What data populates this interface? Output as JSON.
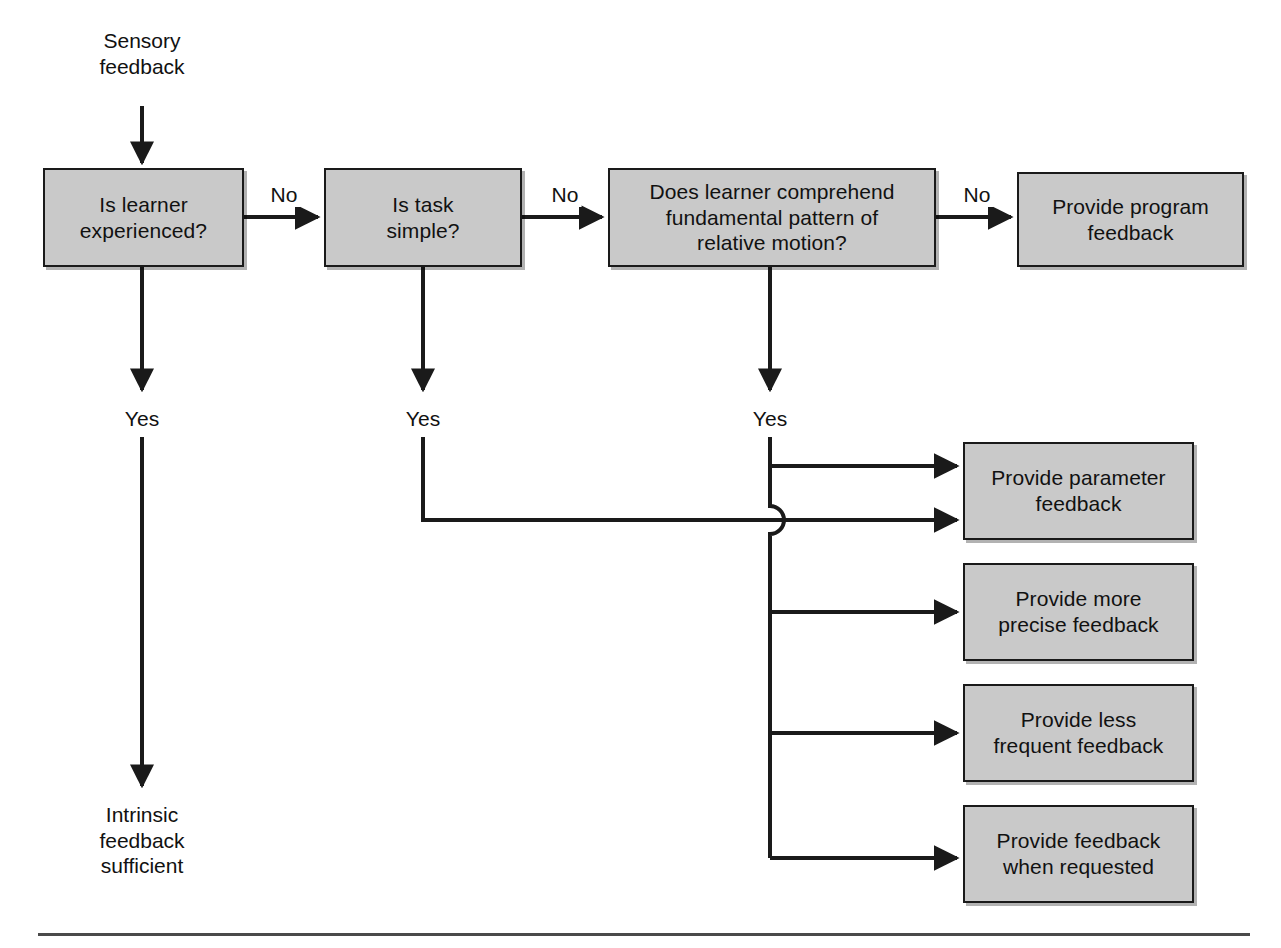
{
  "diagram": {
    "type": "flowchart",
    "colors": {
      "node_fill": "#c9c9c9",
      "node_border": "#1a1a1a",
      "wire": "#1a1a1a",
      "text": "#111111",
      "rule": "#4a4a4a"
    },
    "entry_label": "Sensory\nfeedback",
    "terminal_label": "Intrinsic\nfeedback\nsufficient",
    "nodes": [
      {
        "id": "is-learner-experienced",
        "label": "Is learner\nexperienced?",
        "x": 43,
        "y": 168,
        "w": 201,
        "h": 99
      },
      {
        "id": "is-task-simple",
        "label": "Is task\nsimple?",
        "x": 324,
        "y": 168,
        "w": 198,
        "h": 99
      },
      {
        "id": "does-learner-comprehend",
        "label": "Does learner comprehend\nfundamental pattern of\nrelative motion?",
        "x": 608,
        "y": 168,
        "w": 328,
        "h": 99
      },
      {
        "id": "provide-program-feedback",
        "label": "Provide program\nfeedback",
        "x": 1017,
        "y": 172,
        "w": 227,
        "h": 95
      },
      {
        "id": "provide-parameter-feedback",
        "label": "Provide parameter\nfeedback",
        "x": 963,
        "y": 442,
        "w": 231,
        "h": 98
      },
      {
        "id": "provide-more-precise-feedback",
        "label": "Provide more\nprecise feedback",
        "x": 963,
        "y": 563,
        "w": 231,
        "h": 98
      },
      {
        "id": "provide-less-frequent-feedback",
        "label": "Provide less\nfrequent feedback",
        "x": 963,
        "y": 684,
        "w": 231,
        "h": 98
      },
      {
        "id": "provide-feedback-when-requested",
        "label": "Provide feedback\nwhen requested",
        "x": 963,
        "y": 805,
        "w": 231,
        "h": 98
      }
    ],
    "edge_labels": [
      {
        "id": "no-1",
        "text": "No",
        "x": 284,
        "y": 182
      },
      {
        "id": "no-2",
        "text": "No",
        "x": 565,
        "y": 182
      },
      {
        "id": "no-3",
        "text": "No",
        "x": 977,
        "y": 182
      },
      {
        "id": "yes-1",
        "text": "Yes",
        "x": 142,
        "y": 406
      },
      {
        "id": "yes-2",
        "text": "Yes",
        "x": 423,
        "y": 406
      },
      {
        "id": "yes-3",
        "text": "Yes",
        "x": 770,
        "y": 406
      }
    ],
    "edges": [
      {
        "from": "sensory-feedback",
        "to": "is-learner-experienced",
        "label": ""
      },
      {
        "from": "is-learner-experienced",
        "to": "is-task-simple",
        "label": "No"
      },
      {
        "from": "is-task-simple",
        "to": "does-learner-comprehend",
        "label": "No"
      },
      {
        "from": "does-learner-comprehend",
        "to": "provide-program-feedback",
        "label": "No"
      },
      {
        "from": "is-learner-experienced",
        "to": "intrinsic-feedback-sufficient",
        "label": "Yes"
      },
      {
        "from": "is-task-simple",
        "to": "provide-parameter-feedback",
        "label": "Yes"
      },
      {
        "from": "does-learner-comprehend",
        "to": "provide-parameter-feedback",
        "label": "Yes"
      },
      {
        "from": "does-learner-comprehend",
        "to": "provide-more-precise-feedback",
        "label": "Yes"
      },
      {
        "from": "does-learner-comprehend",
        "to": "provide-less-frequent-feedback",
        "label": "Yes"
      },
      {
        "from": "does-learner-comprehend",
        "to": "provide-feedback-when-requested",
        "label": "Yes"
      }
    ]
  }
}
